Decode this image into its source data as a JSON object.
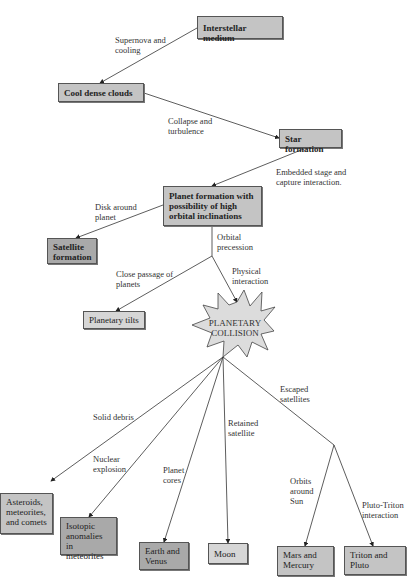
{
  "diagram": {
    "nodes": {
      "interstellar_medium": "Interstellar medium",
      "cool_dense_clouds": "Cool dense clouds",
      "star_formation": "Star formation",
      "planet_formation": "Planet formation with possibility of high orbital inclinations",
      "satellite_formation": "Satellite formation",
      "planetary_tilts": "Planetary tilts",
      "planetary_collision": "PLANETARY COLLISION",
      "asteroids": "Asteroids, meteorites, and comets",
      "isotopic_anomalies": "Isotopic anomalies in meteorites",
      "earth_venus": "Earth and Venus",
      "moon": "Moon",
      "mars_mercury": "Mars and Mercury",
      "triton_pluto": "Triton and Pluto"
    },
    "edge_labels": {
      "supernova": "Supernova and\ncooling",
      "collapse": "Collapse and\nturbulence",
      "embedded": "Embedded stage and\ncapture interaction.",
      "disk": "Disk around\nplanet",
      "orbital_precession": "Orbital\nprecession",
      "close_passage": "Close passage of\nplanets",
      "physical_interaction": "Physical\ninteraction",
      "solid_debris": "Solid debris",
      "nuclear_explosion": "Nuclear\nexplosion",
      "planet_cores": "Planet\ncores",
      "retained_satellite": "Retained\nsatellite",
      "escaped_satellites": "Escaped\nsatellites",
      "orbits_sun": "Orbits\naround\nSun",
      "pluto_triton": "Pluto-Triton\ninteraction"
    }
  }
}
